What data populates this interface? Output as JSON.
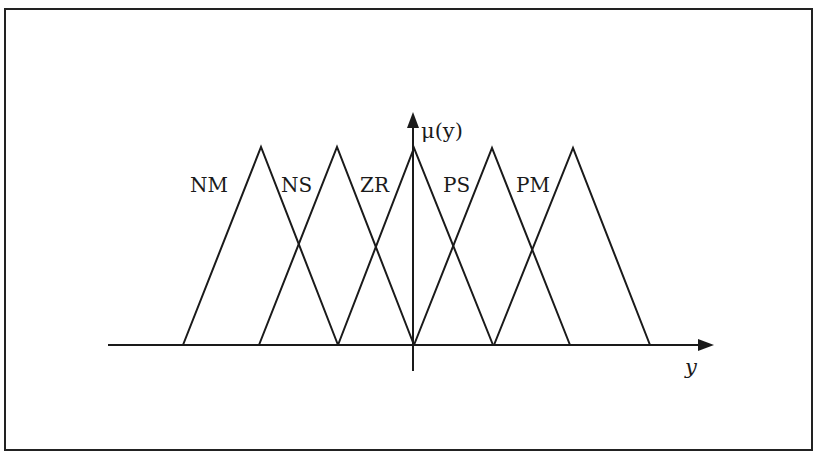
{
  "diagram": {
    "type": "fuzzy-membership-functions",
    "y_axis_label": "μ(y)",
    "x_axis_label": "y",
    "sets": [
      {
        "name": "NM",
        "label": "NM",
        "left": -2,
        "peak": -1.5,
        "right": -1
      },
      {
        "name": "NS",
        "label": "NS",
        "left": -1,
        "peak": -0.5,
        "right": 0
      },
      {
        "name": "ZR",
        "label": "ZR",
        "left": -0.5,
        "peak": 0,
        "right": 0.5
      },
      {
        "name": "PS",
        "label": "PS",
        "left": 0,
        "peak": 0.5,
        "right": 1
      },
      {
        "name": "PM",
        "label": "PM",
        "left": 0.5,
        "peak": 1,
        "right": 1.5
      }
    ],
    "colors": {
      "line": "#1a1a1a",
      "background": "#ffffff",
      "frame": "#222222"
    }
  }
}
